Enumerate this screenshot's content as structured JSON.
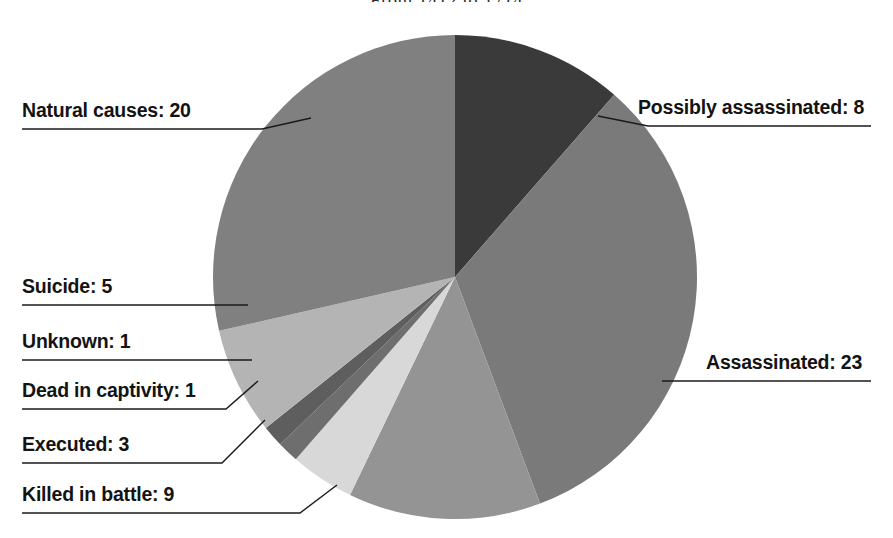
{
  "chart_data": {
    "type": "pie",
    "title": "From 1412 to 1714",
    "xlabel": "",
    "ylabel": "",
    "total": 70,
    "legend_position": "callouts",
    "grid": false,
    "categories": [
      "Possibly assassinated",
      "Assassinated",
      "Killed in battle",
      "Executed",
      "Dead in captivity",
      "Unknown",
      "Suicide",
      "Natural causes"
    ],
    "values": [
      8,
      23,
      9,
      3,
      1,
      1,
      5,
      20
    ],
    "colors": [
      "#3a3a3a",
      "#7a7a7a",
      "#949494",
      "#d8d8d8",
      "#6e6e6e",
      "#5e5e5e",
      "#b4b4b4",
      "#808080"
    ],
    "slices": [
      {
        "label": "Possibly assassinated",
        "value": 8,
        "color": "#3a3a3a"
      },
      {
        "label": "Assassinated",
        "value": 23,
        "color": "#7a7a7a"
      },
      {
        "label": "Killed in battle",
        "value": 9,
        "color": "#949494"
      },
      {
        "label": "Executed",
        "value": 3,
        "color": "#d8d8d8"
      },
      {
        "label": "Dead in captivity",
        "value": 1,
        "color": "#6e6e6e"
      },
      {
        "label": "Unknown",
        "value": 1,
        "color": "#5e5e5e"
      },
      {
        "label": "Suicide",
        "value": 5,
        "color": "#b4b4b4"
      },
      {
        "label": "Natural causes",
        "value": 20,
        "color": "#808080"
      }
    ]
  },
  "title": {
    "text": "From 1412 to 1714"
  },
  "callouts": {
    "natural_causes": "Natural causes: 20",
    "possibly_assassinated": "Possibly assassinated: 8",
    "suicide": "Suicide: 5",
    "unknown": "Unknown: 1",
    "dead_in_captivity": "Dead in captivity: 1",
    "executed": "Executed: 3",
    "killed_in_battle": "Killed in battle: 9",
    "assassinated": "Assassinated: 23"
  }
}
